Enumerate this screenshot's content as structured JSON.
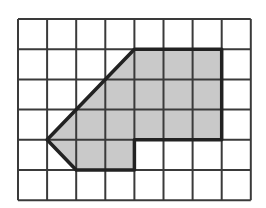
{
  "diagram": {
    "type": "grid-polygon",
    "grid": {
      "columns": 8,
      "rows": 6,
      "origin_x": 18,
      "origin_y": 19,
      "cell_width": 29.1,
      "cell_height": 30.2,
      "line_color": "#3a3a3a",
      "line_width": 2,
      "background": "#ffffff"
    },
    "shape": {
      "fill_color": "#c9c9c9",
      "stroke_color": "#222222",
      "stroke_width": 3.5,
      "vertices_grid": [
        [
          1,
          4
        ],
        [
          2,
          5
        ],
        [
          4,
          5
        ],
        [
          4,
          4
        ],
        [
          7,
          4
        ],
        [
          7,
          1
        ],
        [
          4,
          1
        ]
      ]
    }
  }
}
